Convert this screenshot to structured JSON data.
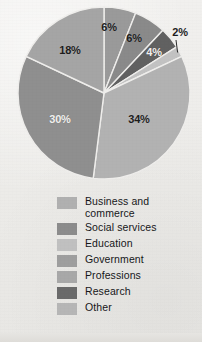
{
  "chart_data": {
    "type": "pie",
    "title": "",
    "subtitle": "",
    "xlabel": "",
    "ylabel": "",
    "legend_position": "bottom",
    "grid": false,
    "start_angle_deg": 0,
    "direction": "clockwise",
    "categories": [
      "Business and commerce",
      "Social services",
      "Research",
      "Other",
      "Education",
      "Government",
      "Professions"
    ],
    "values": [
      6,
      6,
      4,
      2,
      34,
      30,
      18
    ],
    "value_labels": [
      "6%",
      "6%",
      "4%",
      "2%",
      "34%",
      "30%",
      "18%"
    ],
    "colors": [
      "#9a9a9a",
      "#8a8a8a",
      "#616161",
      "#c2c2c2",
      "#b2b2b2",
      "#8f8f8f",
      "#a5a5a5"
    ]
  },
  "pie": {
    "center_x": 104,
    "center_y": 93,
    "radius": 86,
    "separator_color": "#efeeec",
    "slices": [
      {
        "name": "business-and-commerce",
        "label": "6%",
        "value": 6,
        "color": "#9a9a9a",
        "start": 0,
        "end": 6,
        "label_x": 109,
        "label_y": 27,
        "label_tone": "dark",
        "leader": false
      },
      {
        "name": "social-services",
        "label": "6%",
        "value": 6,
        "color": "#8a8a8a",
        "start": 6,
        "end": 12,
        "label_x": 134,
        "label_y": 38,
        "label_tone": "dark",
        "leader": false
      },
      {
        "name": "research",
        "label": "4%",
        "value": 4,
        "color": "#616161",
        "start": 12,
        "end": 16,
        "label_x": 154,
        "label_y": 52,
        "label_tone": "light",
        "leader": false
      },
      {
        "name": "other",
        "label": "2%",
        "value": 2,
        "color": "#c2c2c2",
        "start": 16,
        "end": 18,
        "label_x": 180,
        "label_y": 32,
        "label_tone": "dark",
        "leader": true
      },
      {
        "name": "education",
        "label": "34%",
        "value": 34,
        "color": "#b2b2b2",
        "start": 18,
        "end": 52,
        "label_x": 139,
        "label_y": 119,
        "label_tone": "dark",
        "leader": false
      },
      {
        "name": "government",
        "label": "30%",
        "value": 30,
        "color": "#8f8f8f",
        "start": 52,
        "end": 82,
        "label_x": 60,
        "label_y": 119,
        "label_tone": "light",
        "leader": false
      },
      {
        "name": "professions",
        "label": "18%",
        "value": 18,
        "color": "#a5a5a5",
        "start": 82,
        "end": 100,
        "label_x": 70,
        "label_y": 50,
        "label_tone": "dark",
        "leader": false
      }
    ]
  },
  "legend": {
    "items": [
      {
        "label": "Business and commerce",
        "color": "#b0b0b0",
        "two_line": true
      },
      {
        "label": "Social services",
        "color": "#8c8c8c",
        "two_line": false
      },
      {
        "label": "Education",
        "color": "#c0c0c0",
        "two_line": false
      },
      {
        "label": "Government",
        "color": "#9e9e9e",
        "two_line": false
      },
      {
        "label": "Professions",
        "color": "#a8a8a8",
        "two_line": false
      },
      {
        "label": "Research",
        "color": "#6a6a6a",
        "two_line": false
      },
      {
        "label": "Other",
        "color": "#b6b6b6",
        "two_line": false
      }
    ]
  }
}
